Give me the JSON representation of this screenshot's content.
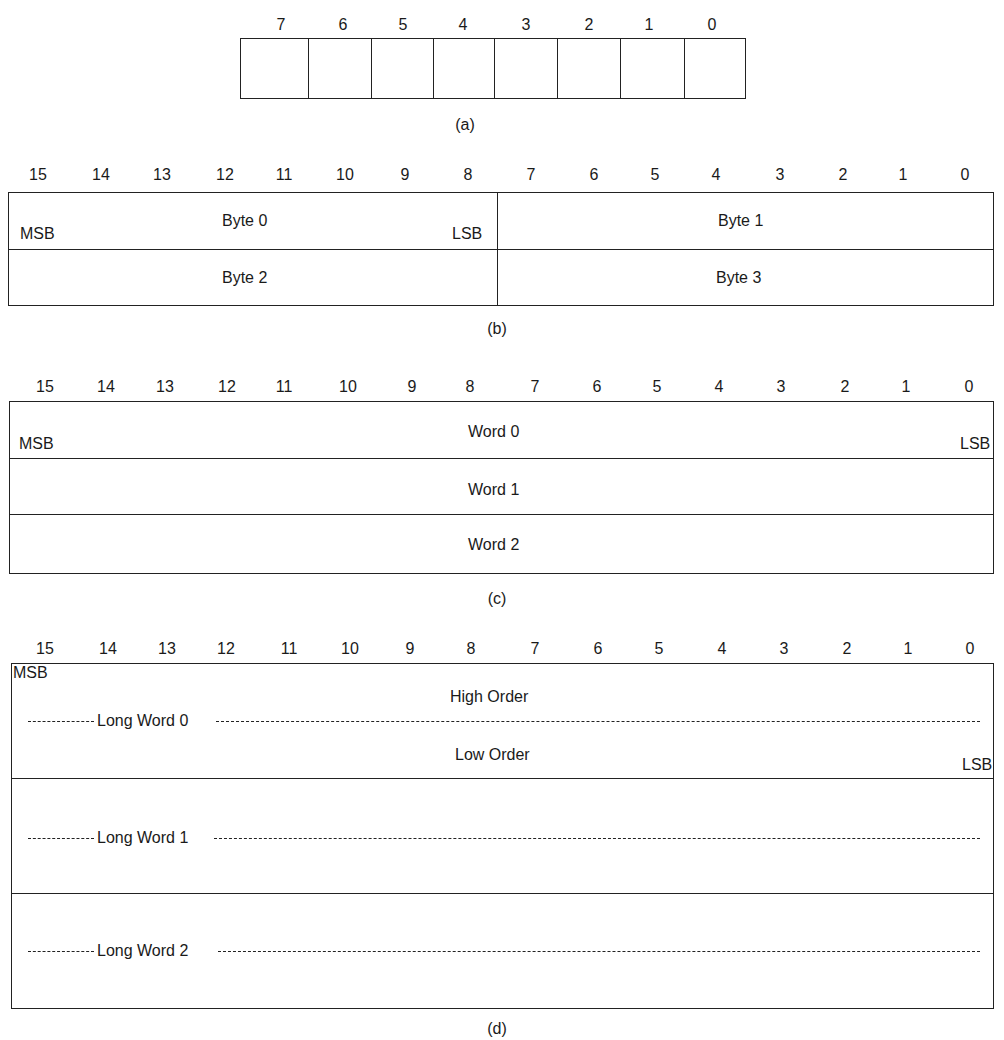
{
  "fig_a": {
    "bits": [
      "7",
      "6",
      "5",
      "4",
      "3",
      "2",
      "1",
      "0"
    ],
    "caption": "(a)"
  },
  "fig_b": {
    "bits": [
      "15",
      "14",
      "13",
      "12",
      "11",
      "10",
      "9",
      "8",
      "7",
      "6",
      "5",
      "4",
      "3",
      "2",
      "1",
      "0"
    ],
    "rows": [
      {
        "left": "Byte 0",
        "right": "Byte 1"
      },
      {
        "left": "Byte 2",
        "right": "Byte 3"
      }
    ],
    "msb": "MSB",
    "lsb": "LSB",
    "caption": "(b)"
  },
  "fig_c": {
    "bits": [
      "15",
      "14",
      "13",
      "12",
      "11",
      "10",
      "9",
      "8",
      "7",
      "6",
      "5",
      "4",
      "3",
      "2",
      "1",
      "0"
    ],
    "rows": [
      "Word 0",
      "Word 1",
      "Word 2"
    ],
    "msb": "MSB",
    "lsb": "LSB",
    "caption": "(c)"
  },
  "fig_d": {
    "bits": [
      "15",
      "14",
      "13",
      "12",
      "11",
      "10",
      "9",
      "8",
      "7",
      "6",
      "5",
      "4",
      "3",
      "2",
      "1",
      "0"
    ],
    "msb": "MSB",
    "lsb": "LSB",
    "high_order": "High Order",
    "low_order": "Low Order",
    "rows": [
      "Long Word 0",
      "Long Word 1",
      "Long Word 2"
    ],
    "caption": "(d)"
  }
}
